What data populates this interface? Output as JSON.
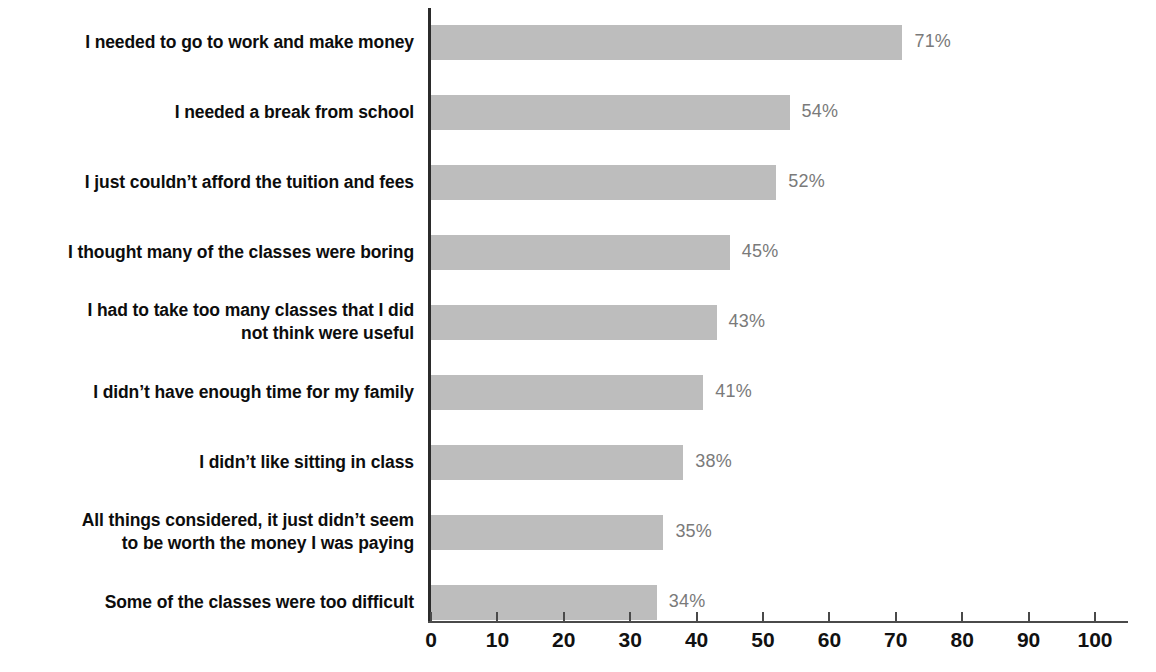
{
  "chart_data": {
    "type": "bar",
    "orientation": "horizontal",
    "title": "",
    "subtitle": "",
    "xlabel": "",
    "ylabel": "",
    "xlim": [
      0,
      100
    ],
    "xticks": [
      0,
      10,
      20,
      30,
      40,
      50,
      60,
      70,
      80,
      90,
      100
    ],
    "xtick_labels": [
      "0",
      "10",
      "20",
      "30",
      "40",
      "50",
      "60",
      "70",
      "80",
      "90",
      "100"
    ],
    "grid": false,
    "legend": null,
    "bar_color": "#bdbdbd",
    "label_color": "#0d0d0d",
    "value_label_color": "#7a7a7a",
    "axis_color": "#2b2b2b",
    "background": "#ffffff",
    "categories": [
      "I needed to go to work and make money",
      "I needed a break from school",
      "I just couldn’t afford the tuition and fees",
      "I thought many of the classes were boring",
      "I had to take too many classes that I did\nnot think were useful",
      "I didn’t have enough time for my family",
      "I didn’t like sitting in class",
      "All things considered, it just didn’t seem\nto be worth the money I was paying",
      "Some of the classes were too difficult"
    ],
    "values": [
      71,
      54,
      52,
      45,
      43,
      41,
      38,
      35,
      34
    ],
    "value_labels": [
      "71%",
      "54%",
      "52%",
      "45%",
      "43%",
      "41%",
      "38%",
      "35%",
      "34%"
    ]
  }
}
